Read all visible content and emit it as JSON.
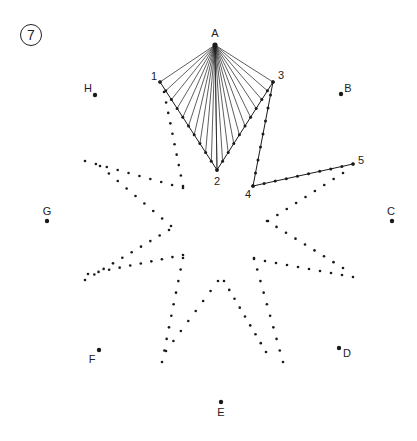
{
  "figure": {
    "number_label": "7",
    "ink_color": "#1a1a1a",
    "line_width": 0.7
  },
  "anchor_points": [
    {
      "id": "A",
      "label": "A",
      "x": 215,
      "y": 45,
      "lx": 215,
      "ly": 33
    },
    {
      "id": "B",
      "label": "B",
      "x": 341,
      "y": 94,
      "lx": 348,
      "ly": 88
    },
    {
      "id": "C",
      "label": "C",
      "x": 392,
      "y": 221,
      "lx": 391,
      "ly": 211
    },
    {
      "id": "D",
      "label": "D",
      "x": 339,
      "y": 348,
      "lx": 347,
      "ly": 353
    },
    {
      "id": "E",
      "label": "E",
      "x": 221,
      "y": 402,
      "lx": 221,
      "ly": 412
    },
    {
      "id": "F",
      "label": "F",
      "x": 99,
      "y": 350,
      "lx": 92,
      "ly": 359
    },
    {
      "id": "G",
      "label": "G",
      "x": 47,
      "y": 221,
      "lx": 47,
      "ly": 211
    },
    {
      "id": "H",
      "label": "H",
      "x": 95,
      "y": 95,
      "lx": 88,
      "ly": 88
    }
  ],
  "numbered_points": [
    {
      "id": "1",
      "label": "1",
      "x": 160,
      "y": 82,
      "lx": 154,
      "ly": 76
    },
    {
      "id": "2",
      "label": "2",
      "x": 217,
      "y": 170,
      "lx": 217,
      "ly": 181
    },
    {
      "id": "3",
      "label": "3",
      "x": 273,
      "y": 82,
      "lx": 281,
      "ly": 75
    },
    {
      "id": "4",
      "label": "4",
      "x": 253,
      "y": 186,
      "lx": 248,
      "ly": 194
    },
    {
      "id": "5",
      "label": "5",
      "x": 353,
      "y": 164,
      "lx": 361,
      "ly": 160
    }
  ],
  "string_fans": [
    {
      "apex": [
        215,
        45
      ],
      "from": [
        160,
        82
      ],
      "to": [
        217,
        170
      ],
      "count": 11
    },
    {
      "apex": [
        215,
        45
      ],
      "from": [
        217,
        170
      ],
      "to": [
        273,
        82
      ],
      "count": 11
    }
  ],
  "solid_lines": [
    {
      "from": [
        160,
        82
      ],
      "to": [
        217,
        170
      ],
      "dots": 11
    },
    {
      "from": [
        217,
        170
      ],
      "to": [
        273,
        82
      ],
      "dots": 11
    },
    {
      "from": [
        273,
        82
      ],
      "to": [
        253,
        186
      ],
      "dots": 9
    },
    {
      "from": [
        253,
        186
      ],
      "to": [
        353,
        164
      ],
      "dots": 10
    }
  ],
  "dotted_lines": [
    {
      "from": [
        164,
        92
      ],
      "to": [
        183,
        186
      ],
      "count": 10
    },
    {
      "from": [
        85,
        161
      ],
      "to": [
        183,
        188
      ],
      "count": 10
    },
    {
      "from": [
        100,
        166
      ],
      "to": [
        171,
        226
      ],
      "count": 9
    },
    {
      "from": [
        169,
        230
      ],
      "to": [
        85,
        280
      ],
      "count": 10
    },
    {
      "from": [
        88,
        274
      ],
      "to": [
        183,
        255
      ],
      "count": 10
    },
    {
      "from": [
        183,
        258
      ],
      "to": [
        162,
        362
      ],
      "count": 10
    },
    {
      "from": [
        166,
        351
      ],
      "to": [
        218,
        281
      ],
      "count": 8
    },
    {
      "from": [
        224,
        281
      ],
      "to": [
        266,
        352
      ],
      "count": 9
    },
    {
      "from": [
        254,
        258
      ],
      "to": [
        283,
        362
      ],
      "count": 10
    },
    {
      "from": [
        254,
        259
      ],
      "to": [
        353,
        277
      ],
      "count": 10
    },
    {
      "from": [
        343,
        268
      ],
      "to": [
        267,
        221
      ],
      "count": 9
    },
    {
      "from": [
        268,
        221
      ],
      "to": [
        343,
        173
      ],
      "count": 9
    }
  ]
}
